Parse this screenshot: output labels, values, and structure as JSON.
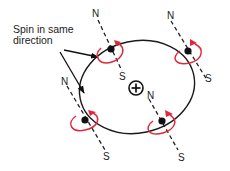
{
  "diagram": {
    "annotation": {
      "line1": "Spin in same",
      "line2": "direction"
    },
    "nucleus": {
      "symbol": "+",
      "label": "nucleus"
    },
    "electrons": [
      {
        "id": "top-left",
        "north": "N",
        "south": "S"
      },
      {
        "id": "top-right",
        "north": "N",
        "south": "S"
      },
      {
        "id": "left",
        "north": "N",
        "south": "S"
      },
      {
        "id": "bottom-right",
        "north": "N",
        "south": "S"
      }
    ],
    "colors": {
      "orbit": "#1a1a1a",
      "spin_arrow": "#e0283a",
      "electron": "#111111",
      "text": "#222222"
    }
  }
}
